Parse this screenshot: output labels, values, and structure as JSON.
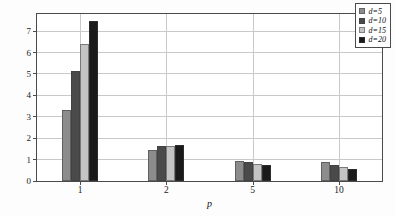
{
  "chart_data": {
    "type": "bar",
    "title": "",
    "subtitle": "",
    "xlabel": "p",
    "ylabel": "平均（最大-最小）距离",
    "categories": [
      "1",
      "2",
      "5",
      "10"
    ],
    "series": [
      {
        "name": "d=5",
        "color": "#8c8c8c",
        "values": [
          3.3,
          1.45,
          0.95,
          0.89
        ]
      },
      {
        "name": "d=10",
        "color": "#4a4a4a",
        "values": [
          5.12,
          1.63,
          0.87,
          0.76
        ]
      },
      {
        "name": "d=15",
        "color": "#c4c4c4",
        "values": [
          6.42,
          1.63,
          0.8,
          0.66
        ]
      },
      {
        "name": "d=20",
        "color": "#1a1a1a",
        "values": [
          7.48,
          1.68,
          0.74,
          0.57
        ]
      }
    ],
    "ylim": [
      0,
      7.8
    ],
    "yticks": [
      0,
      1,
      2,
      3,
      4,
      5,
      6,
      7
    ],
    "ytick_labels": [
      "0",
      "1",
      "2",
      "3",
      "4",
      "5",
      "6",
      "7"
    ],
    "xtick_labels": [
      "1",
      "2",
      "5",
      "10"
    ],
    "grid": true,
    "grid_axis": "both",
    "legend_position": "top-right-inside",
    "legend_entries": [
      "d=5",
      "d=10",
      "d=15",
      "d=20"
    ],
    "background_color": "#ffffff",
    "axis_color": "#4a4a4a",
    "grid_color": "#c9c9c9"
  },
  "legend": {
    "items": [
      {
        "label": "d=5"
      },
      {
        "label": "d=10"
      },
      {
        "label": "d=15"
      },
      {
        "label": "d=20"
      }
    ]
  },
  "axes": {
    "y_title": "平均（最大-最小）距离",
    "x_title": "p"
  }
}
